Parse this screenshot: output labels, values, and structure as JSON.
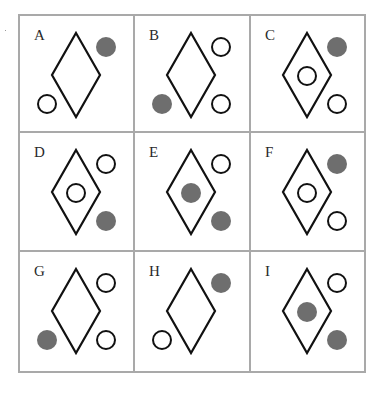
{
  "puzzle": {
    "colors": {
      "filled": "#6e6e6e",
      "stroke": "#111111",
      "grid": "#a9a9a9"
    },
    "cells": [
      {
        "label": "A",
        "top_right": "filled",
        "center": "none",
        "bottom_left": "open",
        "bottom_right": "none"
      },
      {
        "label": "B",
        "top_right": "open",
        "center": "none",
        "bottom_left": "filled",
        "bottom_right": "open"
      },
      {
        "label": "C",
        "top_right": "filled",
        "center": "open",
        "bottom_left": "none",
        "bottom_right": "open"
      },
      {
        "label": "D",
        "top_right": "open",
        "center": "open",
        "bottom_left": "none",
        "bottom_right": "filled"
      },
      {
        "label": "E",
        "top_right": "open",
        "center": "filled",
        "bottom_left": "none",
        "bottom_right": "filled"
      },
      {
        "label": "F",
        "top_right": "filled",
        "center": "open",
        "bottom_left": "none",
        "bottom_right": "open"
      },
      {
        "label": "G",
        "top_right": "open",
        "center": "none",
        "bottom_left": "filled",
        "bottom_right": "open"
      },
      {
        "label": "H",
        "top_right": "filled",
        "center": "none",
        "bottom_left": "open",
        "bottom_right": "none"
      },
      {
        "label": "I",
        "top_right": "open",
        "center": "filled",
        "bottom_left": "none",
        "bottom_right": "filled"
      }
    ]
  }
}
